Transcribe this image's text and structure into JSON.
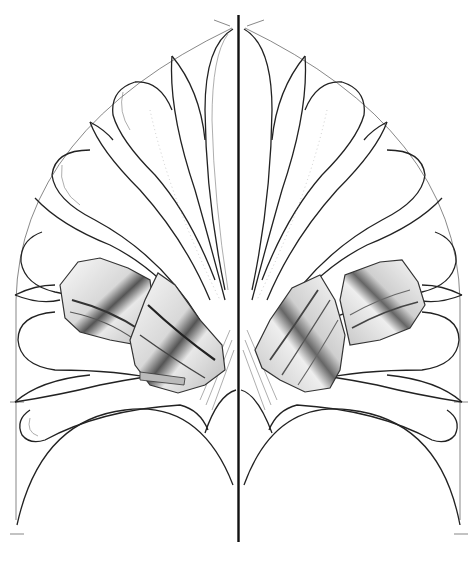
{
  "figure": {
    "colors": {
      "background": "#ffffff",
      "line": "#222222",
      "construction": "#555555",
      "fragment_dark": "#444444",
      "fragment_light": "#f2f2f2"
    }
  }
}
